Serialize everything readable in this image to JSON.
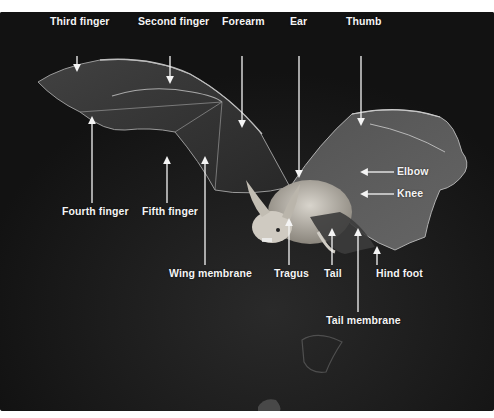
{
  "diagram": {
    "colors": {
      "background": "#151515",
      "label_text": "#f4f4f4",
      "arrow": "#f4f4f4",
      "page": "#ffffff"
    },
    "labels": {
      "third_finger": "Third finger",
      "second_finger": "Second finger",
      "forearm": "Forearm",
      "ear": "Ear",
      "thumb": "Thumb",
      "elbow": "Elbow",
      "knee": "Knee",
      "fourth_finger": "Fourth finger",
      "fifth_finger": "Fifth finger",
      "wing_membrane": "Wing membrane",
      "tragus": "Tragus",
      "tail": "Tail",
      "hind_foot": "Hind foot",
      "tail_membrane": "Tail membrane"
    }
  }
}
